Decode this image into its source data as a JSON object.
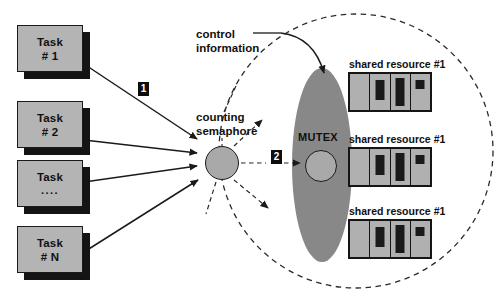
{
  "diagram": {
    "colors": {
      "task_fill": "#b4b4b4",
      "task_shadow": "#141414",
      "outline": "#1a1a1a",
      "ellipse_fill": "#888888",
      "disc_fill": "#a9a9a9",
      "resource_fill": "#b0b0b0",
      "badge_fill": "#0d0d0d",
      "badge_text": "#ffffff",
      "background": "#ffffff"
    }
  },
  "tasks": [
    {
      "name": "task-1",
      "line1": "Task",
      "line2": "# 1"
    },
    {
      "name": "task-2",
      "line1": "Task",
      "line2": "# 2"
    },
    {
      "name": "task-ellipsis",
      "line1": "Task",
      "line2": "...."
    },
    {
      "name": "task-n",
      "line1": "Task",
      "line2": "# N"
    }
  ],
  "labels": {
    "control_information_line1": "control",
    "control_information_line2": "information",
    "counting_semaphore_line1": "counting",
    "counting_semaphore_line2": "semaphore",
    "mutex": "MUTEX"
  },
  "badges": [
    {
      "name": "step-1",
      "text": "1"
    },
    {
      "name": "step-2",
      "text": "2"
    }
  ],
  "resources": [
    {
      "name": "shared-resource-top",
      "label": "shared resource #1"
    },
    {
      "name": "shared-resource-middle",
      "label": "shared resource #1"
    },
    {
      "name": "shared-resource-bottom",
      "label": "shared resource #1"
    }
  ],
  "resource_cells": [
    {
      "name": "cell-empty",
      "bar_height": 0,
      "bar_width": 0
    },
    {
      "name": "cell-medium",
      "bar_height": 20,
      "bar_width": 9
    },
    {
      "name": "cell-tall",
      "bar_height": 28,
      "bar_width": 9
    },
    {
      "name": "cell-small",
      "bar_height": 9,
      "bar_width": 9
    }
  ],
  "icons": {
    "semaphore_flag": "flag-left-icon",
    "dashed_boundary": "dashed-circle-icon",
    "control_arrow": "curved-arrow-icon"
  }
}
